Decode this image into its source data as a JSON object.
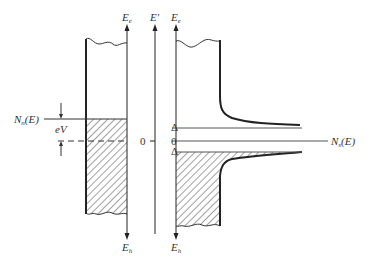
{
  "diagram": {
    "left_panel": {
      "top_axis_label": "E",
      "top_axis_sub": "e",
      "bottom_axis_label": "E",
      "bottom_axis_sub": "h",
      "dos_label": "N",
      "dos_sub": "n",
      "dos_arg": "(E)",
      "bias_label": "eV"
    },
    "center_axis": {
      "label": "E′",
      "zero_label": "0"
    },
    "right_panel": {
      "top_axis_label": "E",
      "top_axis_sub": "e",
      "bottom_axis_label": "E",
      "bottom_axis_sub": "h",
      "gap_upper_label": "Δ",
      "zero_label": "0",
      "gap_lower_label": "Δ",
      "dos_label": "N",
      "dos_sub": "s",
      "dos_arg": "(E)"
    },
    "colors": {
      "line": "#222222",
      "thin_line": "#555555",
      "hatch": "#444444",
      "background": "#ffffff"
    }
  }
}
